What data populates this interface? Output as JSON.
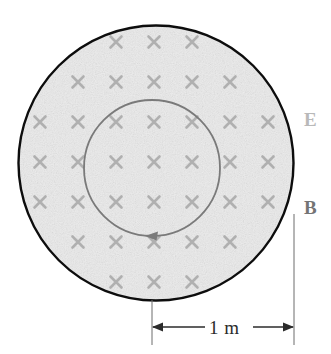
{
  "figure": {
    "background_color": "#ffffff",
    "canvas": {
      "width": 331,
      "height": 354
    }
  },
  "outer_region": {
    "name": "magnetic-field-region",
    "center_x": 156,
    "center_y": 163,
    "radius": 138,
    "fill_color": "#ececec",
    "stroke_color": "#0d0d0d",
    "stroke_width": 2.4
  },
  "inner_loop": {
    "name": "amperian-loop",
    "center_x": 152,
    "center_y": 168,
    "radius": 68,
    "stroke_color": "#7a7a7a",
    "stroke_width": 1.8,
    "direction": "counterclockwise",
    "arrow_position": "bottom",
    "arrow_points": "left"
  },
  "field_marks": {
    "name": "magnetic-field-into-page",
    "glyph": "x",
    "color": "#b0b0b0",
    "spacing_x": 38,
    "spacing_y": 40,
    "size": 11,
    "origin_x": 40,
    "origin_y": 42,
    "columns": 7,
    "rows": 7
  },
  "labels": {
    "electric_field": "E",
    "electric_field_color": "#b9b9b9",
    "magnetic_field": "B",
    "magnetic_field_color": "#747474"
  },
  "dimension": {
    "name": "radius-dimension",
    "value": "1 m",
    "line_color": "#2b2b2b",
    "left_x": 152,
    "right_x": 294,
    "y": 327,
    "extension_top_left": 300,
    "extension_top_right": 214,
    "extension_bottom": 345
  }
}
